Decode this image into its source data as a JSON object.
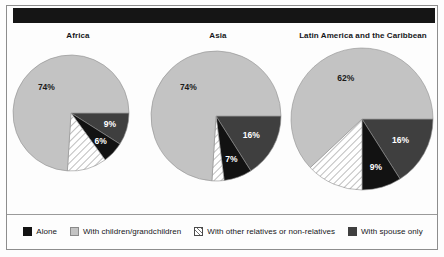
{
  "figure": {
    "background_color": "#fdfdfd",
    "header_bar_color": "#151515",
    "border_color": "#8d8d8d"
  },
  "palette": {
    "alone": "#121212",
    "with_children_grandchildren": "#c3c3c3",
    "with_other_relatives": "#ffffff",
    "with_spouse_only": "#3f3f3f",
    "hatch_line": "#6e6e6e"
  },
  "legend": {
    "position": "bottom-center",
    "items": [
      {
        "label": "Alone",
        "key": "alone",
        "swatch_class": "sw-alone"
      },
      {
        "label": "With children/grandchildren",
        "key": "with_children_grandchildren",
        "swatch_class": "sw-children"
      },
      {
        "label": "With other relatives or non-relatives",
        "key": "with_other_relatives",
        "swatch_class": "sw-other"
      },
      {
        "label": "With spouse only",
        "key": "with_spouse_only",
        "swatch_class": "sw-spouse"
      }
    ]
  },
  "panels": [
    {
      "title": "Africa"
    },
    {
      "title": "Asia"
    },
    {
      "title": "Latin America and the Caribbean"
    }
  ],
  "chart_data": {
    "type": "pie",
    "title": "",
    "subtitle": "",
    "xlabel": "",
    "ylabel": "",
    "grid": false,
    "legend_position": "bottom-center",
    "value_unit": "percent",
    "categories": [
      "With spouse only",
      "Alone",
      "With other relatives or non-relatives",
      "With children/grandchildren"
    ],
    "panels": [
      {
        "title": "Africa",
        "slices": [
          {
            "category": "With spouse only",
            "value": 9,
            "label": "9%",
            "color": "#3f3f3f",
            "label_color": "light"
          },
          {
            "category": "Alone",
            "value": 6,
            "label": "6%",
            "color": "#121212",
            "label_color": "light"
          },
          {
            "category": "With other relatives or non-relatives",
            "value": 11,
            "label": "",
            "color": "#ffffff",
            "label_color": "dark"
          },
          {
            "category": "With children/grandchildren",
            "value": 74,
            "label": "74%",
            "color": "#c3c3c3",
            "label_color": "dark"
          }
        ]
      },
      {
        "title": "Asia",
        "slices": [
          {
            "category": "With spouse only",
            "value": 16,
            "label": "16%",
            "color": "#3f3f3f",
            "label_color": "light"
          },
          {
            "category": "Alone",
            "value": 7,
            "label": "7%",
            "color": "#121212",
            "label_color": "light"
          },
          {
            "category": "With other relatives or non-relatives",
            "value": 3,
            "label": "",
            "color": "#ffffff",
            "label_color": "dark"
          },
          {
            "category": "With children/grandchildren",
            "value": 74,
            "label": "74%",
            "color": "#c3c3c3",
            "label_color": "dark"
          }
        ]
      },
      {
        "title": "Latin America and the Caribbean",
        "slices": [
          {
            "category": "With spouse only",
            "value": 16,
            "label": "16%",
            "color": "#3f3f3f",
            "label_color": "light"
          },
          {
            "category": "Alone",
            "value": 9,
            "label": "9%",
            "color": "#121212",
            "label_color": "light"
          },
          {
            "category": "With other relatives or non-relatives",
            "value": 13,
            "label": "",
            "color": "#ffffff",
            "label_color": "dark"
          },
          {
            "category": "With children/grandchildren",
            "value": 62,
            "label": "62%",
            "color": "#c3c3c3",
            "label_color": "dark"
          }
        ]
      }
    ]
  }
}
